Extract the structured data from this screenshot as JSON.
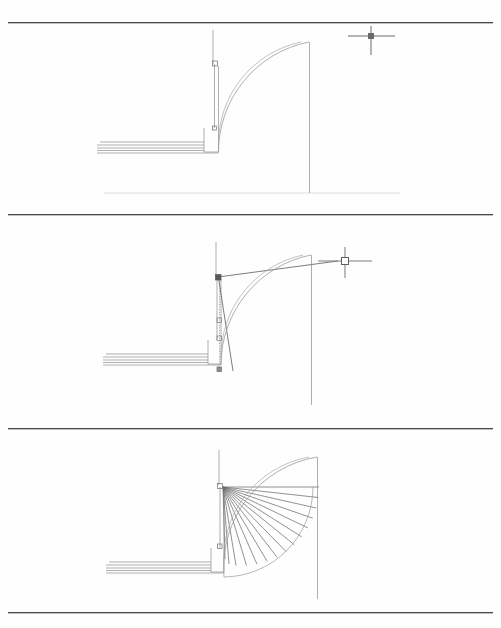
{
  "page": {
    "width": 501,
    "height": 628,
    "background_color": "#fefefe",
    "rule_color": "#4a4a4a",
    "line_color": "#8d8d8d",
    "dark_line_color": "#555555"
  },
  "rules": [
    {
      "name": "top-rule",
      "y": 22
    },
    {
      "name": "divider-rule-1",
      "y": 214
    },
    {
      "name": "divider-rule-2",
      "y": 428
    },
    {
      "name": "bottom-rule",
      "y": 612
    }
  ],
  "caption": {
    "text": "",
    "visible_fragment": "",
    "note": "bottom caption line is cropped by the page edge; only the tops of glyphs are visible"
  },
  "figures": [
    {
      "id": "figure-1",
      "name": "step-1-curved-wall-plan",
      "label": "",
      "elements": {
        "crosshair_cursor": {
          "name": "crosshair-cursor",
          "x": 371,
          "y": 36,
          "arm_h": 24,
          "arm_v": 20,
          "pickbox": 5,
          "pickbox_filled": true
        },
        "vertical_guide_top": {
          "x1": 213,
          "y1": 30,
          "x2": 213,
          "y2": 63
        },
        "wall_vertical": {
          "x": 216,
          "top": 63,
          "bottom": 127,
          "thickness": 4
        },
        "wall_horizontal": {
          "y": 140,
          "left": 98,
          "right": 216,
          "thickness": 10,
          "line_count": 5
        },
        "landing_block": {
          "x": 204,
          "y": 127,
          "w": 14,
          "h": 24
        },
        "arc_outer": {
          "cx": 310,
          "cy": 41,
          "r": 112
        },
        "arc_inner": {
          "cx": 310,
          "cy": 41,
          "r": 104
        },
        "right_vertical_wall": {
          "x": 310,
          "y1": 42,
          "y2": 193
        },
        "floor_line": {
          "y": 193,
          "x1": 104,
          "x2": 400
        }
      }
    },
    {
      "id": "figure-2",
      "name": "step-2-rubber-band-line-and-tracking",
      "label": "",
      "elements": {
        "crosshair_cursor": {
          "name": "crosshair-cursor",
          "x": 345,
          "y": 261,
          "arm_h": 26,
          "arm_v": 22,
          "pickbox": 7,
          "pickbox_filled": false
        },
        "rubber_band_line": {
          "x1": 217,
          "y1": 277,
          "x2": 341,
          "y2": 261
        },
        "tracking_dotted_line": {
          "x": 220,
          "y1": 277,
          "y2": 369
        },
        "snap_markers": [
          {
            "name": "snap-marker-top",
            "x": 217,
            "y": 277
          },
          {
            "name": "snap-marker-mid",
            "x": 220,
            "y": 320
          },
          {
            "name": "snap-marker-mid-2",
            "x": 220,
            "y": 338
          },
          {
            "name": "snap-marker-bottom",
            "x": 220,
            "y": 369
          }
        ],
        "angled_chord": {
          "x1": 218,
          "y1": 277,
          "x2": 233,
          "y2": 370
        },
        "vertical_guide_top": {
          "x1": 216,
          "y1": 242,
          "x2": 216,
          "y2": 276
        },
        "wall_vertical": {
          "x": 219,
          "top": 277,
          "bottom": 340,
          "thickness": 4
        },
        "wall_horizontal": {
          "y": 353,
          "left": 104,
          "right": 219,
          "thickness": 10,
          "line_count": 5
        },
        "landing_block": {
          "x": 208,
          "y": 340,
          "w": 14,
          "h": 24
        },
        "arc_outer": {
          "cx": 312,
          "cy": 255,
          "r": 112
        },
        "arc_inner": {
          "cx": 312,
          "cy": 255,
          "r": 104
        },
        "right_vertical_wall": {
          "x": 312,
          "y1": 256,
          "y2": 404
        }
      }
    },
    {
      "id": "figure-3",
      "name": "step-3-radial-stair-treads-fan",
      "label": "",
      "elements": {
        "pivot_point": {
          "x": 222,
          "y": 487
        },
        "radial_line_count": 15,
        "radial_start_angle_deg": 0,
        "radial_end_angle_deg": 92,
        "radial_radius": 96,
        "tread_arc_outer": {
          "cx": 318,
          "cy": 468,
          "r": 112
        },
        "tread_arc_inner": {
          "cx": 318,
          "cy": 468,
          "r": 104
        },
        "stair_nosing_arc": {
          "cx": 222,
          "cy": 487,
          "r": 90
        },
        "vertical_guide_top": {
          "x1": 219,
          "y1": 450,
          "x2": 219,
          "y2": 485
        },
        "wall_vertical": {
          "x": 222,
          "top": 487,
          "bottom": 548,
          "thickness": 4
        },
        "wall_horizontal": {
          "y": 560,
          "left": 107,
          "right": 222,
          "thickness": 10,
          "line_count": 5
        },
        "landing_block": {
          "x": 211,
          "y": 548,
          "w": 14,
          "h": 24
        },
        "right_vertical_wall": {
          "x": 318,
          "y1": 469,
          "y2": 608
        }
      }
    }
  ]
}
